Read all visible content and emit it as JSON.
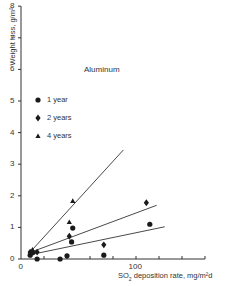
{
  "chart_data": {
    "type": "scatter",
    "title": "Aluminum",
    "xlabel": "SO2 deposition rate, mg/m²d",
    "xlabel_parts": {
      "pre": "SO",
      "sub": "2",
      "post": " deposition rate, mg/m²d"
    },
    "ylabel": "Weight loss, g/m²",
    "xlim": [
      0,
      160
    ],
    "ylim": [
      0,
      8
    ],
    "x_ticks": [
      0,
      20,
      40,
      60,
      80,
      100,
      120,
      140,
      160
    ],
    "x_tick_labels": [
      "0",
      "",
      "",
      "",
      "",
      "100",
      "",
      "",
      ""
    ],
    "y_ticks": [
      0,
      1,
      2,
      3,
      4,
      5,
      6,
      7,
      8
    ],
    "y_tick_labels": [
      "0",
      "1",
      "2",
      "3",
      "4",
      "5",
      "6",
      "7",
      "8"
    ],
    "grid": false,
    "legend_position": "upper-left",
    "series": [
      {
        "name": "1 year",
        "marker": "circle",
        "points": [
          [
            8,
            0.12
          ],
          [
            10,
            0.2
          ],
          [
            14,
            0.0
          ],
          [
            34,
            0.0
          ],
          [
            40,
            0.1
          ],
          [
            45,
            0.98
          ],
          [
            44,
            0.54
          ],
          [
            72,
            0.12
          ],
          [
            112,
            1.1
          ]
        ],
        "fit_line": [
          [
            6,
            0.12
          ],
          [
            125,
            1.02
          ]
        ]
      },
      {
        "name": "2 years",
        "marker": "diamond",
        "points": [
          [
            8,
            0.22
          ],
          [
            14,
            0.22
          ],
          [
            42,
            0.72
          ],
          [
            72,
            0.45
          ],
          [
            109,
            1.78
          ]
        ],
        "fit_line": [
          [
            6,
            0.18
          ],
          [
            118,
            1.7
          ]
        ]
      },
      {
        "name": "4 years",
        "marker": "triangle",
        "points": [
          [
            10,
            0.3
          ],
          [
            42,
            1.17
          ],
          [
            45,
            1.84
          ]
        ],
        "fit_line": [
          [
            10,
            0.3
          ],
          [
            89,
            3.45
          ]
        ]
      }
    ]
  },
  "legend": [
    {
      "label": "1 year",
      "marker": "circle"
    },
    {
      "label": "2 years",
      "marker": "diamond"
    },
    {
      "label": "4 years",
      "marker": "triangle"
    }
  ],
  "colors": {
    "ink": "#1a1a1a",
    "axis": "#333333",
    "background": "#ffffff"
  }
}
